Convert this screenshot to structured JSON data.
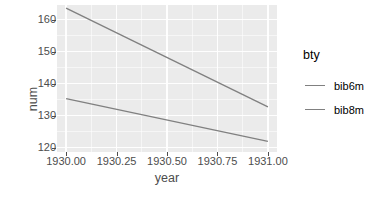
{
  "chart_data": {
    "type": "line",
    "title": "",
    "xlabel": "year",
    "ylabel": "num",
    "xlim": [
      1929.955,
      1931.045
    ],
    "ylim": [
      118.6,
      164.6
    ],
    "grid": true,
    "legend_position": "right",
    "legend_title": "bty",
    "x_ticks": [
      1930.0,
      1930.25,
      1930.5,
      1930.75,
      1931.0
    ],
    "x_tick_labels": [
      "1930.00",
      "1930.25",
      "1930.50",
      "1930.75",
      "1931.00"
    ],
    "y_ticks": [
      120,
      130,
      140,
      150,
      160
    ],
    "y_tick_labels": [
      "120",
      "130",
      "140",
      "150",
      "160"
    ],
    "x": [
      1930,
      1931
    ],
    "series": [
      {
        "name": "bib6m",
        "color": "#808080",
        "values": [
          163.6,
          132.7
        ]
      },
      {
        "name": "bib8m",
        "color": "#808080",
        "values": [
          135.3,
          121.9
        ]
      }
    ]
  },
  "legend": {
    "title": "bty",
    "items": [
      {
        "label": "bib6m"
      },
      {
        "label": "bib8m"
      }
    ]
  },
  "axes": {
    "x_title": "year",
    "y_title": "num",
    "x_tick_labels": [
      "1930.00",
      "1930.25",
      "1930.50",
      "1930.75",
      "1931.00"
    ],
    "y_tick_labels": [
      "120",
      "130",
      "140",
      "150",
      "160"
    ]
  },
  "theme": {
    "panel_background": "#ebebeb",
    "grid_color": "#ffffff",
    "line_color": "#808080",
    "text_color": "#4d4d4d",
    "title_color": "#000000"
  }
}
